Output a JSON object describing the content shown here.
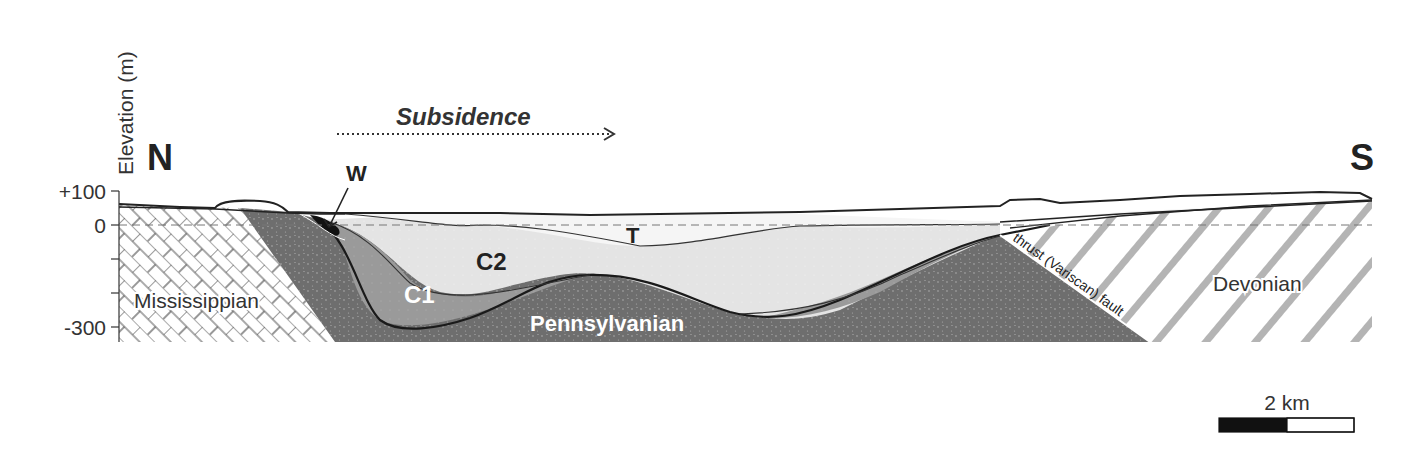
{
  "figure": {
    "type": "geological cross-section",
    "orientation": {
      "left": "N",
      "right": "S"
    }
  },
  "axis": {
    "label": "Elevation (m)",
    "ticks": [
      {
        "value": 100,
        "label": "+100"
      },
      {
        "value": 0,
        "label": "0"
      },
      {
        "value": -100,
        "label": ""
      },
      {
        "value": -200,
        "label": ""
      },
      {
        "value": -300,
        "label": "-300"
      }
    ]
  },
  "annotations": {
    "subsidence": "Subsidence",
    "w_label": "W",
    "t_label": "T",
    "c2_label": "C2",
    "c1_label": "C1",
    "fault_label": "thrust (Variscan) fault"
  },
  "units": {
    "mississippian": "Mississippian",
    "pennsylvanian": "Pennsylvanian",
    "devonian": "Devonian"
  },
  "scale_bar": {
    "label": "2 km"
  },
  "colors": {
    "pennsylvanian": "#6e6e6e",
    "c1": "#9a9a9a",
    "c2": "#e3e3e3",
    "t": "#f4f4f4",
    "w": "#111111",
    "line": "#222222",
    "devonian_hatch": "#b0b0b0"
  }
}
